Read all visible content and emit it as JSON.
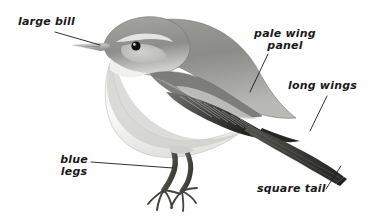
{
  "figure": {
    "type": "labelled-bird-illustration",
    "background_color": "#ffffff",
    "label_color": "#1a1a1a",
    "leader_line_color": "#1a1a1a",
    "width": 387,
    "height": 224
  },
  "annotations": [
    {
      "id": "large-bill",
      "text": "large bill",
      "lines": [
        "large bill"
      ],
      "align": "left",
      "leader": {
        "x1": 55,
        "y1": 32,
        "x2": 100,
        "y2": 45
      }
    },
    {
      "id": "pale-wing-panel",
      "text": "pale wing\npanel",
      "lines": [
        "pale wing",
        "panel"
      ],
      "align": "center",
      "leader": {
        "x1": 268,
        "y1": 54,
        "x2": 250,
        "y2": 92
      }
    },
    {
      "id": "long-wings",
      "text": "long wings",
      "lines": [
        "long wings"
      ],
      "align": "left",
      "leader": {
        "x1": 327,
        "y1": 96,
        "x2": 310,
        "y2": 131
      }
    },
    {
      "id": "blue-legs",
      "text": "blue\nlegs",
      "lines": [
        "blue",
        "legs"
      ],
      "align": "center",
      "leader": {
        "x1": 91,
        "y1": 162,
        "x2": 173,
        "y2": 168
      }
    },
    {
      "id": "square-tail",
      "text": "square tail",
      "lines": [
        "square tail"
      ],
      "align": "left",
      "leader": {
        "x1": 326,
        "y1": 189,
        "x2": 341,
        "y2": 166
      }
    }
  ],
  "illustration_colors": {
    "upperparts": "#8f8f8c",
    "upperparts_dark": "#6b6b68",
    "crown": "#9a9a96",
    "underparts": "#f2f2f0",
    "flank_shade": "#d8d8d4",
    "wing_feathers": "#4a4a48",
    "wing_dark": "#2e2e2c",
    "tail": "#3c3c3a",
    "bill": "#c8c8c4",
    "eye": "#111111",
    "legs": "#55554f",
    "outline": "#6f6f6b"
  }
}
